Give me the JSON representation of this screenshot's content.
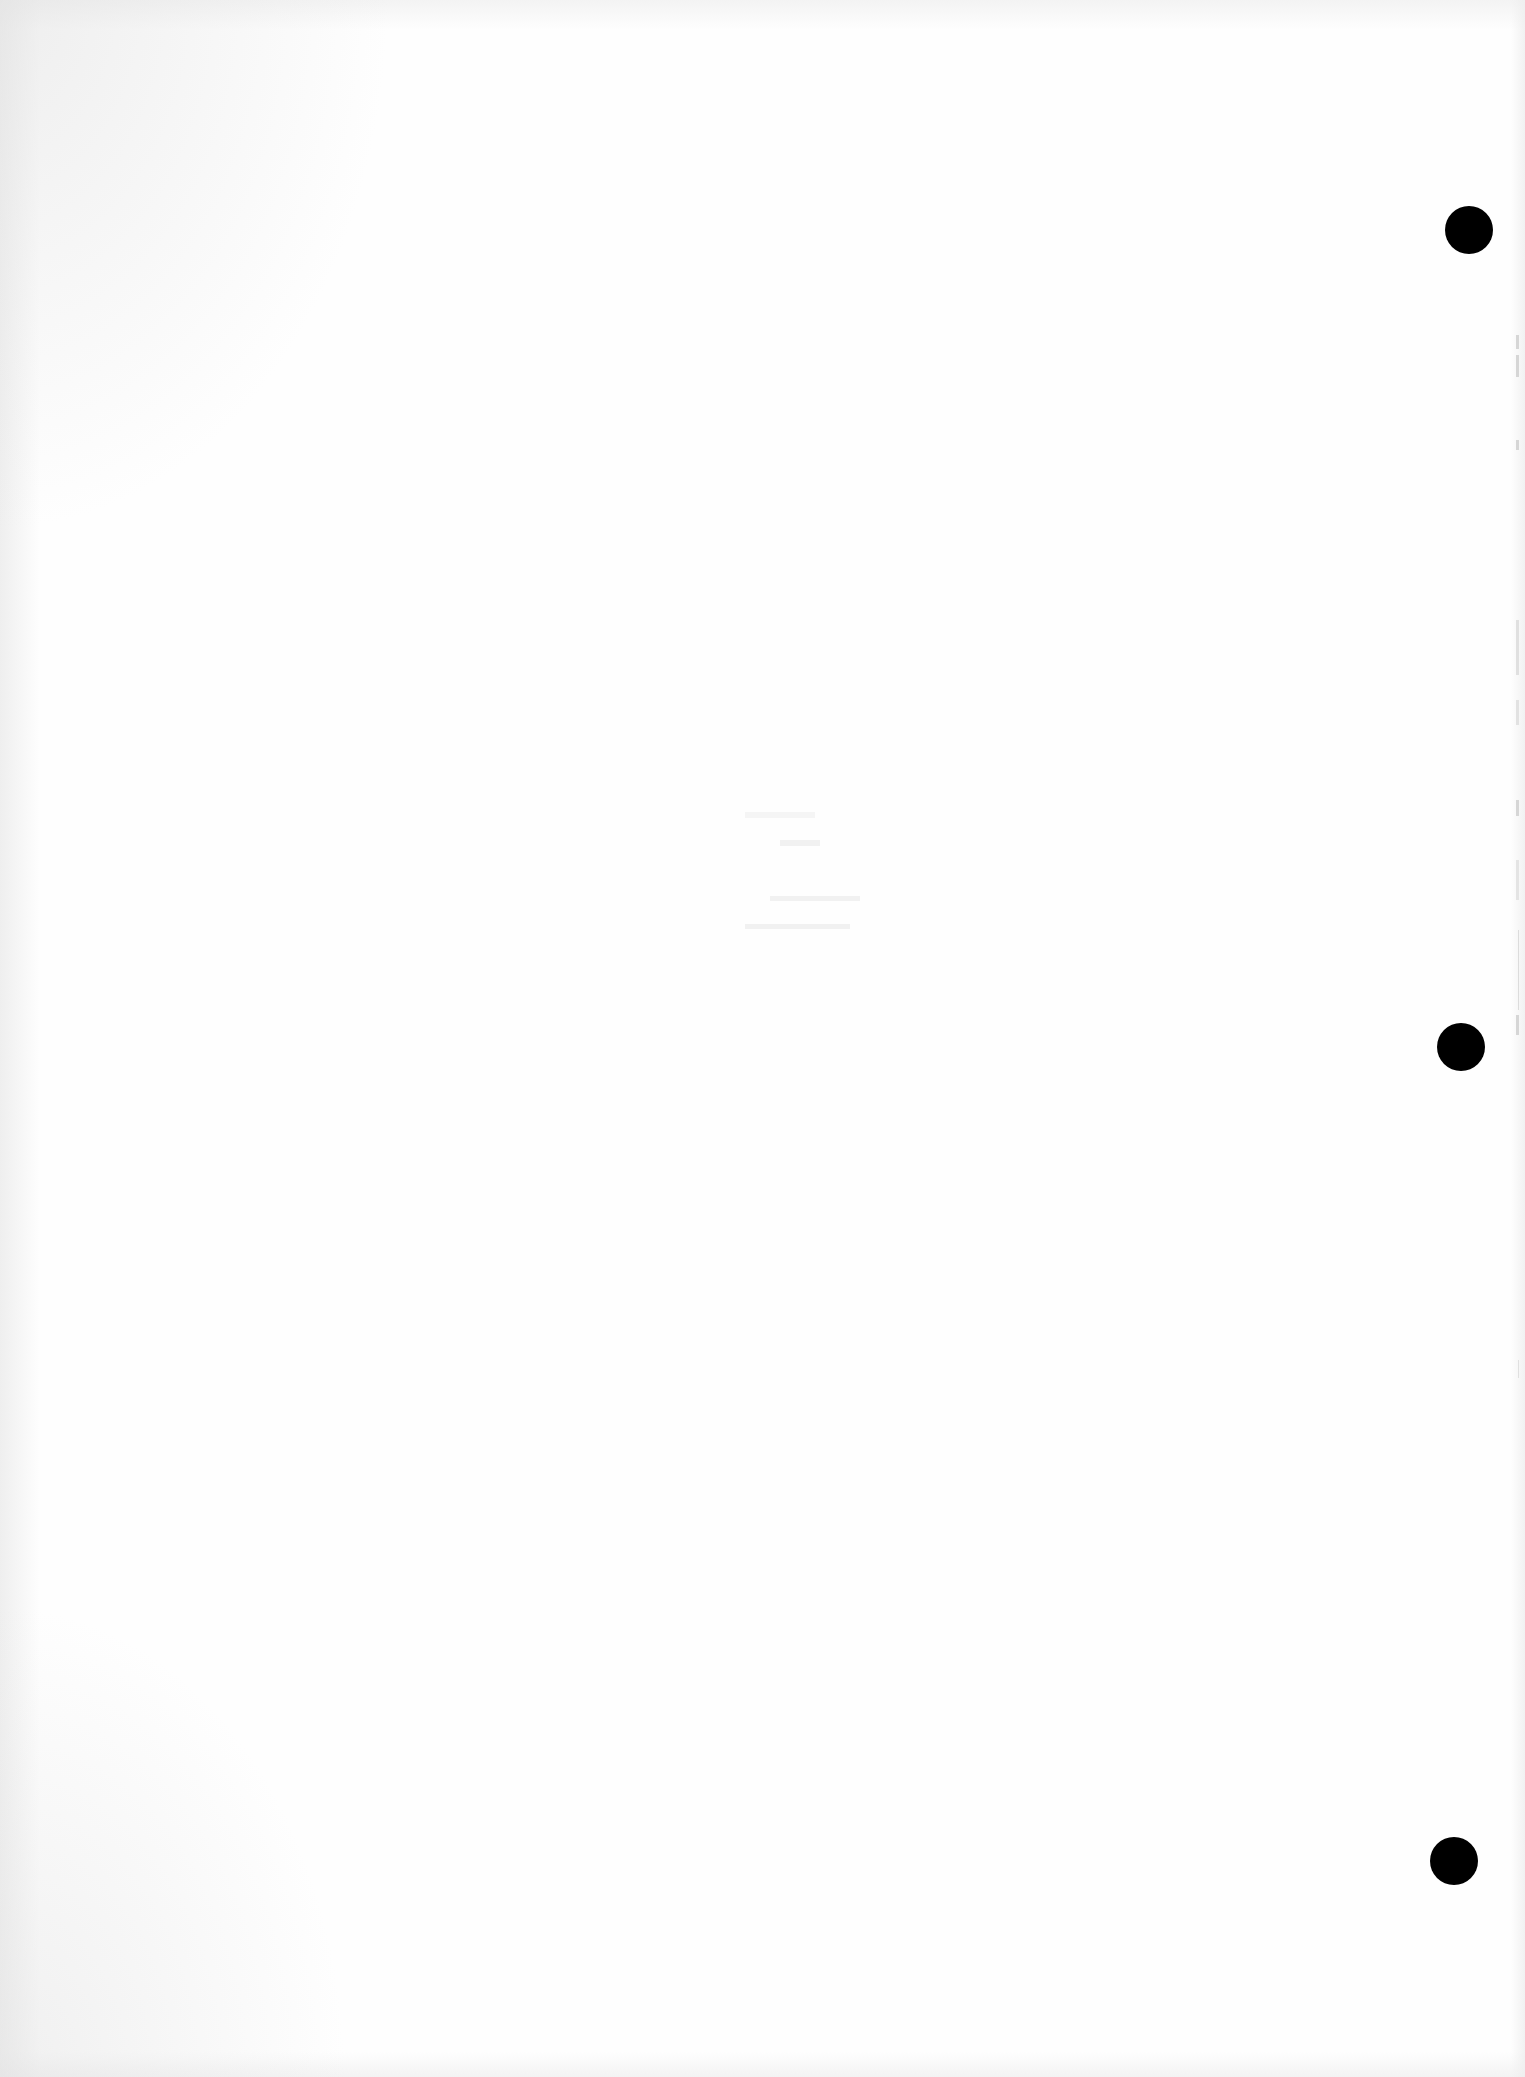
{
  "document": {
    "type": "blank scanned page",
    "background_color": "#fefefe",
    "punch_hole_color": "#000000"
  },
  "punch_holes": [
    {
      "id": "top",
      "cx": 1469,
      "cy": 230,
      "r": 24
    },
    {
      "id": "middle",
      "cx": 1461,
      "cy": 1047,
      "r": 24
    },
    {
      "id": "bottom",
      "cx": 1454,
      "cy": 1861,
      "r": 24
    }
  ],
  "bleed_through_text": {
    "lines": [
      "",
      "",
      "",
      ""
    ],
    "legible": false
  }
}
